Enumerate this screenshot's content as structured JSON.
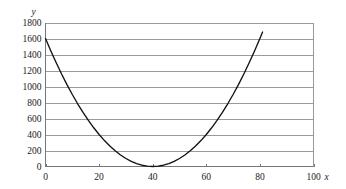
{
  "chart_data": {
    "type": "line",
    "title": "",
    "subtitle": "",
    "xlabel": "x",
    "ylabel": "y",
    "xlim": [
      0,
      100
    ],
    "ylim": [
      0,
      1800
    ],
    "grid": "horizontal",
    "legend": "none",
    "xticks": [
      0,
      20,
      40,
      60,
      80,
      100
    ],
    "xticklabels": [
      "0",
      "20",
      "40",
      "60",
      "80",
      "100"
    ],
    "yticks": [
      0,
      200,
      400,
      600,
      800,
      1000,
      1200,
      1400,
      1600,
      1800
    ],
    "yticklabels": [
      "0",
      "200",
      "400",
      "600",
      "800",
      "1000",
      "1200",
      "1400",
      "1600",
      "1800"
    ],
    "curve_color": "#111111",
    "grid_color": "#9a9a9a",
    "axis_color": "#777777",
    "annotations": {
      "vertex_x": 40,
      "vertex_y": 0,
      "start_point": [
        0,
        1600
      ],
      "end_point": [
        81,
        1681
      ]
    },
    "series": [
      {
        "name": "y = (x - 40)^2",
        "x": [
          0,
          2,
          4,
          6,
          8,
          10,
          12,
          14,
          16,
          18,
          20,
          22,
          24,
          26,
          28,
          30,
          32,
          34,
          36,
          38,
          40,
          42,
          44,
          46,
          48,
          50,
          52,
          54,
          56,
          58,
          60,
          62,
          64,
          66,
          68,
          70,
          72,
          74,
          76,
          78,
          80,
          81
        ],
        "values": [
          1600,
          1444,
          1296,
          1156,
          1024,
          900,
          784,
          676,
          576,
          484,
          400,
          324,
          256,
          196,
          144,
          100,
          64,
          36,
          16,
          4,
          0,
          4,
          16,
          36,
          64,
          100,
          144,
          196,
          256,
          324,
          400,
          484,
          576,
          676,
          784,
          900,
          1024,
          1156,
          1296,
          1444,
          1600,
          1681
        ]
      }
    ]
  }
}
